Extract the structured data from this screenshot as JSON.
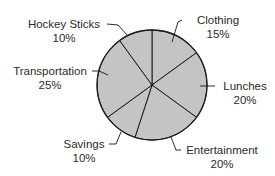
{
  "chart_data": {
    "type": "pie",
    "title": "",
    "start_angle": "top (12 o'clock), clockwise",
    "colors": {
      "slice_fill": "#c4c4c4",
      "slice_stroke": "#1e1e1e",
      "label_text": "#2b2b2b",
      "background": "#ffffff"
    },
    "slices": [
      {
        "label": "Clothing",
        "value": 15,
        "value_label": "15%"
      },
      {
        "label": "Lunches",
        "value": 20,
        "value_label": "20%"
      },
      {
        "label": "Entertainment",
        "value": 20,
        "value_label": "20%"
      },
      {
        "label": "Savings",
        "value": 10,
        "value_label": "10%"
      },
      {
        "label": "Transportation",
        "value": 25,
        "value_label": "25%"
      },
      {
        "label": "Hockey Sticks",
        "value": 10,
        "value_label": "10%"
      }
    ],
    "legend": "none (callout labels with leader lines)"
  }
}
